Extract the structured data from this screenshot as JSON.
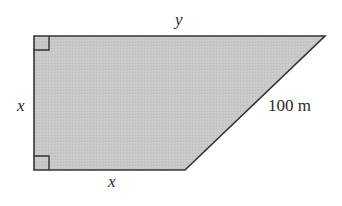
{
  "diagram": {
    "type": "right trapezoid",
    "colors": {
      "fill": "#c9c9c9",
      "stroke": "#333333",
      "text": "#2a2a2a",
      "background": "#ffffff"
    },
    "vertices": {
      "top_left": [
        34,
        36
      ],
      "top_right": [
        325,
        36
      ],
      "bottom_right": [
        185,
        170
      ],
      "bottom_left": [
        34,
        170
      ]
    },
    "labels": {
      "top_side": "y",
      "left_side": "x",
      "bottom_side": "x",
      "slanted_side": "100 m"
    },
    "right_angle_markers": [
      "top-left",
      "bottom-left"
    ]
  }
}
